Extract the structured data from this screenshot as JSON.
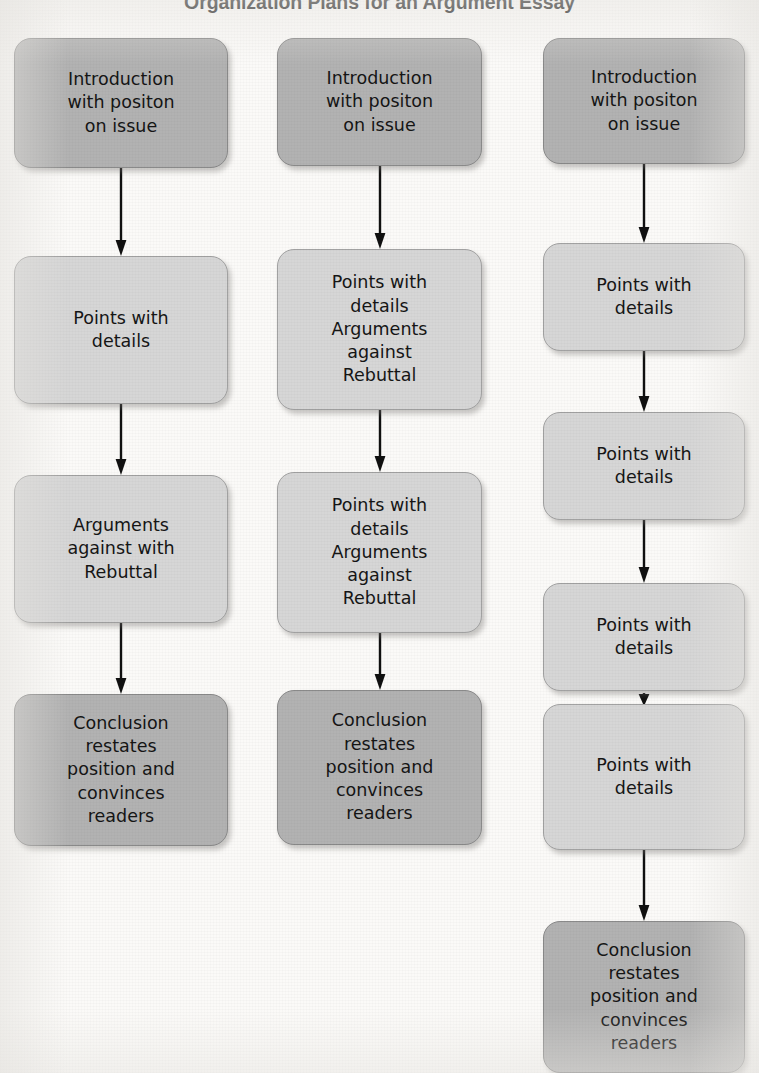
{
  "title": "Organization Plans for an Argument Essay",
  "colors": {
    "background": "#fbfaf8",
    "box_dark": "#b2b2b2",
    "box_light": "#d6d6d6",
    "box_border": "#8e8e8e",
    "arrow": "#101010",
    "text": "#151515",
    "title_text": "#1c1c1c"
  },
  "labels": {
    "introduction": "Introduction\nwith positon\non issue",
    "points_details": "Points with\ndetails",
    "arguments_against_rebuttal": "Arguments\nagainst with\nRebuttal",
    "points_arguments_rebuttal": "Points with\ndetails\nArguments\nagainst\nRebuttal",
    "conclusion": "Conclusion\nrestates\nposition and\nconvinces\nreaders"
  },
  "columns": [
    {
      "name": "plan-1",
      "x": 14,
      "width": 214,
      "nodes": [
        {
          "name": "introduction",
          "text": "Introduction\nwith positon\non issue",
          "tone": "dark",
          "y": 38,
          "height": 130
        },
        {
          "name": "points-details",
          "text": "Points with\ndetails",
          "tone": "light",
          "y": 256,
          "height": 148
        },
        {
          "name": "arguments-against-rebuttal",
          "text": "Arguments\nagainst with\nRebuttal",
          "tone": "light",
          "y": 475,
          "height": 148
        },
        {
          "name": "conclusion",
          "text": "Conclusion\nrestates\nposition and\nconvinces\nreaders",
          "tone": "dark",
          "y": 694,
          "height": 152
        }
      ],
      "arrows": [
        {
          "name": "arrow-intro-to-points",
          "y": 168,
          "height": 88
        },
        {
          "name": "arrow-points-to-arguments",
          "y": 404,
          "height": 71
        },
        {
          "name": "arrow-arguments-to-conclusion",
          "y": 623,
          "height": 71
        }
      ]
    },
    {
      "name": "plan-2",
      "x": 277,
      "width": 205,
      "nodes": [
        {
          "name": "introduction",
          "text": "Introduction\nwith positon\non issue",
          "tone": "dark",
          "y": 38,
          "height": 128
        },
        {
          "name": "points-arguments-rebuttal-1",
          "text": "Points with\ndetails\nArguments\nagainst\nRebuttal",
          "tone": "light",
          "y": 249,
          "height": 161
        },
        {
          "name": "points-arguments-rebuttal-2",
          "text": "Points with\ndetails\nArguments\nagainst\nRebuttal",
          "tone": "light",
          "y": 472,
          "height": 161
        },
        {
          "name": "conclusion",
          "text": "Conclusion\nrestates\nposition and\nconvinces\nreaders",
          "tone": "dark",
          "y": 690,
          "height": 155
        }
      ],
      "arrows": [
        {
          "name": "arrow-intro-to-body-1",
          "y": 166,
          "height": 83
        },
        {
          "name": "arrow-body-1-to-body-2",
          "y": 410,
          "height": 62
        },
        {
          "name": "arrow-body-2-to-conclusion",
          "y": 633,
          "height": 57
        }
      ]
    },
    {
      "name": "plan-3",
      "x": 543,
      "width": 202,
      "nodes": [
        {
          "name": "introduction",
          "text": "Introduction\nwith positon\non issue",
          "tone": "dark",
          "y": 38,
          "height": 126
        },
        {
          "name": "points-details-1",
          "text": "Points with\ndetails",
          "tone": "light",
          "y": 243,
          "height": 108
        },
        {
          "name": "points-details-2",
          "text": "Points with\ndetails",
          "tone": "light",
          "y": 412,
          "height": 108
        },
        {
          "name": "points-details-3",
          "text": "Points with\ndetails",
          "tone": "light",
          "y": 583,
          "height": 108
        },
        {
          "name": "points-details-4",
          "text": "Points with\ndetails",
          "tone": "light",
          "y": 704,
          "height": 146
        },
        {
          "name": "conclusion",
          "text": "Conclusion\nrestates\nposition and\nconvinces\nreaders",
          "tone": "dark",
          "y": 921,
          "height": 152
        }
      ],
      "arrows": [
        {
          "name": "arrow-intro-to-points-1",
          "y": 164,
          "height": 79
        },
        {
          "name": "arrow-points-1-to-points-2",
          "y": 351,
          "height": 61
        },
        {
          "name": "arrow-points-2-to-points-3",
          "y": 520,
          "height": 63
        },
        {
          "name": "arrow-points-3-to-points-4",
          "y": 691,
          "height": 13
        },
        {
          "name": "arrow-points-4-to-conclusion",
          "y": 850,
          "height": 71
        }
      ]
    }
  ]
}
